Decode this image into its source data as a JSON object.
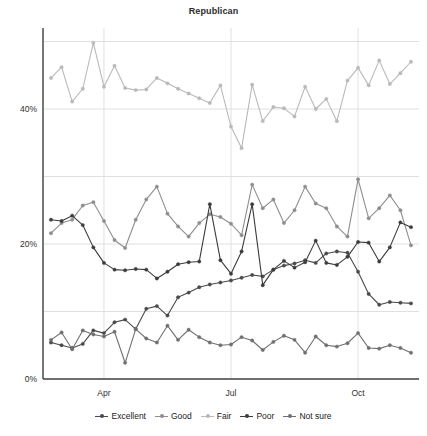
{
  "chart_data": {
    "type": "line",
    "title": "Republican",
    "xlabel": "",
    "ylabel": "",
    "ylim": [
      0,
      52
    ],
    "yticks": [
      0,
      20,
      40
    ],
    "ytick_labels": [
      "0%",
      "20%",
      "40%"
    ],
    "gridlines_y": [
      0,
      10,
      20,
      30,
      40,
      50
    ],
    "grid": true,
    "legend_position": "bottom",
    "x_tick_positions": [
      5,
      17,
      29
    ],
    "x_tick_labels": [
      "Apr",
      "Jul",
      "Oct"
    ],
    "x": [
      0,
      1,
      2,
      3,
      4,
      5,
      6,
      7,
      8,
      9,
      10,
      11,
      12,
      13,
      14,
      15,
      16,
      17,
      18,
      19,
      20,
      21,
      22,
      23,
      24,
      25,
      26,
      27,
      28,
      29,
      30,
      31,
      32,
      33,
      34
    ],
    "series": [
      {
        "name": "Excellent",
        "color": "#4a4a4a",
        "values": [
          5.4,
          5.0,
          4.6,
          5.2,
          7.2,
          6.8,
          8.4,
          8.8,
          7.4,
          10.4,
          10.8,
          9.4,
          12.1,
          12.8,
          13.6,
          14.0,
          14.3,
          14.6,
          15.0,
          15.4,
          15.2,
          16.2,
          16.8,
          17.1,
          17.6,
          17.2,
          18.6,
          18.9,
          18.7,
          15.9,
          12.6,
          11.0,
          11.4,
          11.3,
          11.2
        ]
      },
      {
        "name": "Good",
        "color": "#8e8e8e",
        "values": [
          21.6,
          23.1,
          23.6,
          25.7,
          26.2,
          23.4,
          20.6,
          19.4,
          23.6,
          26.6,
          28.5,
          24.5,
          22.6,
          21.1,
          23.1,
          24.4,
          24.0,
          23.0,
          21.3,
          28.8,
          25.3,
          26.6,
          23.1,
          25.0,
          28.5,
          26.0,
          25.3,
          22.6,
          21.1,
          29.6,
          23.8,
          25.3,
          27.2,
          25.0,
          19.8
        ]
      },
      {
        "name": "Fair",
        "color": "#b9b9b9",
        "values": [
          44.6,
          46.2,
          41.1,
          43.0,
          49.8,
          43.3,
          46.4,
          43.1,
          42.8,
          42.9,
          44.6,
          43.8,
          43.0,
          42.3,
          41.6,
          40.9,
          43.5,
          37.4,
          34.2,
          43.6,
          38.2,
          40.3,
          40.1,
          38.9,
          43.3,
          40.0,
          41.5,
          38.2,
          44.2,
          46.1,
          43.5,
          47.2,
          43.7,
          45.3,
          47.0
        ]
      },
      {
        "name": "Poor",
        "color": "#3c3c3c",
        "values": [
          23.6,
          23.4,
          24.2,
          22.8,
          19.5,
          17.2,
          16.2,
          16.1,
          16.3,
          16.2,
          14.9,
          15.9,
          17.0,
          17.3,
          17.4,
          25.9,
          17.6,
          15.6,
          18.9,
          25.9,
          13.9,
          16.2,
          17.5,
          16.5,
          17.3,
          20.5,
          17.2,
          16.9,
          18.1,
          20.3,
          20.2,
          17.4,
          19.5,
          23.2,
          22.5
        ]
      },
      {
        "name": "Not sure",
        "color": "#707070",
        "values": [
          5.8,
          6.9,
          4.4,
          7.2,
          6.6,
          6.3,
          7.0,
          2.4,
          7.4,
          6.0,
          5.4,
          7.9,
          5.8,
          7.3,
          6.2,
          5.4,
          5.0,
          5.1,
          6.2,
          5.7,
          4.3,
          5.5,
          6.4,
          5.8,
          3.9,
          6.3,
          5.0,
          4.8,
          5.3,
          6.8,
          4.6,
          4.5,
          5.0,
          4.6,
          3.9
        ]
      }
    ]
  },
  "legend": {
    "items": [
      {
        "label": "Excellent"
      },
      {
        "label": "Good"
      },
      {
        "label": "Fair"
      },
      {
        "label": "Poor"
      },
      {
        "label": "Not sure"
      }
    ]
  }
}
